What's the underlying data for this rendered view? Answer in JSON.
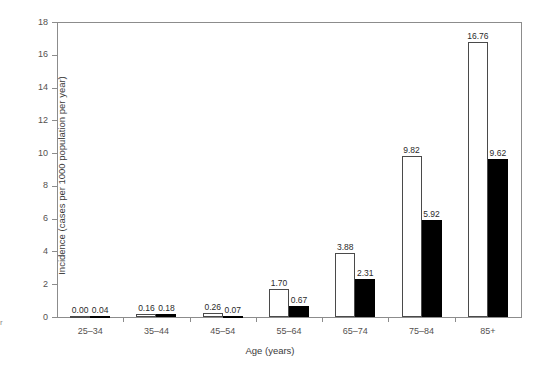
{
  "chart_data": {
    "type": "bar",
    "title": "",
    "xlabel": "Age (years)",
    "ylabel": "Incidence (cases per 1000 population per year)",
    "categories": [
      "25–34",
      "35–44",
      "45–54",
      "55–64",
      "65–74",
      "75–84",
      "85+"
    ],
    "series": [
      {
        "name": "series-1",
        "style": "open",
        "values": [
          0.0,
          0.16,
          0.26,
          1.7,
          3.88,
          9.82,
          16.76
        ],
        "labels": [
          "0.00",
          "0.16",
          "0.26",
          "1.70",
          "3.88",
          "9.82",
          "16.76"
        ]
      },
      {
        "name": "series-2",
        "style": "filled",
        "values": [
          0.04,
          0.18,
          0.07,
          0.67,
          2.31,
          5.92,
          9.62
        ],
        "labels": [
          "0.04",
          "0.18",
          "0.07",
          "0.67",
          "2.31",
          "5.92",
          "9.62"
        ]
      }
    ],
    "ylim": [
      0,
      18
    ],
    "yticks": [
      0,
      2,
      4,
      6,
      8,
      10,
      12,
      14,
      16,
      18
    ],
    "ytick_labels": [
      "0",
      "2",
      "4",
      "6",
      "8",
      "10",
      "12",
      "14",
      "16",
      "18"
    ],
    "grid": false,
    "legend": "none",
    "colors": {
      "open_bar_fill": "#ffffff",
      "open_bar_edge": "#4a4a4a",
      "filled_bar": "#000000",
      "axis": "#8c8c8c",
      "text": "#55514f"
    }
  },
  "edge_fragment": "r"
}
